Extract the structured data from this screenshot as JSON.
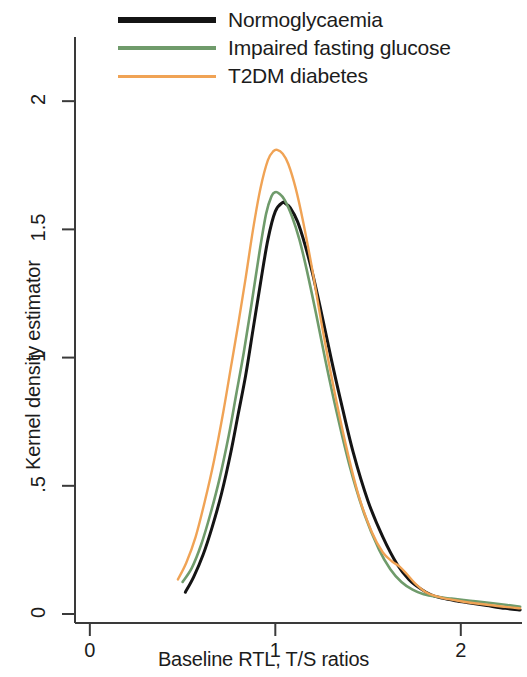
{
  "chart_data": {
    "type": "line",
    "title": "",
    "xlabel": "Baseline RTL, T/S ratios",
    "ylabel": "Kernel density estimator",
    "xlim": [
      -0.08,
      2.33
    ],
    "ylim": [
      -0.035,
      2.18
    ],
    "xticks": [
      0,
      1,
      2
    ],
    "xtick_labels": [
      "0",
      "1",
      "2"
    ],
    "yticks": [
      0,
      0.5,
      1,
      1.5,
      2
    ],
    "ytick_labels": [
      "0",
      ".5",
      "1",
      "1.5",
      "2"
    ],
    "grid": false,
    "legend_position": "top-center",
    "series": [
      {
        "name": "Normoglycaemia",
        "color": "#141414",
        "width": 3.0,
        "x": [
          0.515,
          0.56,
          0.61,
          0.66,
          0.71,
          0.76,
          0.8,
          0.84,
          0.88,
          0.92,
          0.96,
          1.0,
          1.04,
          1.055,
          1.08,
          1.12,
          1.16,
          1.2,
          1.25,
          1.3,
          1.35,
          1.42,
          1.5,
          1.58,
          1.66,
          1.72,
          1.78,
          1.84,
          1.9,
          1.97,
          2.05,
          2.14,
          2.24,
          2.32
        ],
        "y": [
          0.085,
          0.145,
          0.23,
          0.34,
          0.47,
          0.63,
          0.78,
          0.93,
          1.11,
          1.29,
          1.46,
          1.57,
          1.605,
          1.6,
          1.585,
          1.53,
          1.44,
          1.33,
          1.17,
          1.0,
          0.84,
          0.63,
          0.44,
          0.3,
          0.19,
          0.135,
          0.1,
          0.075,
          0.062,
          0.052,
          0.043,
          0.033,
          0.022,
          0.016
        ]
      },
      {
        "name": "Impaired fasting glucose",
        "color": "#6f9b6b",
        "width": 2.6,
        "x": [
          0.5,
          0.55,
          0.6,
          0.65,
          0.7,
          0.75,
          0.79,
          0.83,
          0.87,
          0.91,
          0.95,
          0.98,
          1.0,
          1.02,
          1.05,
          1.09,
          1.13,
          1.17,
          1.22,
          1.27,
          1.33,
          1.4,
          1.48,
          1.56,
          1.62,
          1.68,
          1.74,
          1.8,
          1.87,
          1.95,
          2.05,
          2.15,
          2.25,
          2.32
        ],
        "y": [
          0.125,
          0.18,
          0.27,
          0.39,
          0.53,
          0.7,
          0.86,
          1.02,
          1.2,
          1.39,
          1.56,
          1.63,
          1.645,
          1.64,
          1.615,
          1.55,
          1.46,
          1.34,
          1.17,
          0.99,
          0.79,
          0.58,
          0.39,
          0.25,
          0.175,
          0.125,
          0.095,
          0.077,
          0.067,
          0.06,
          0.052,
          0.044,
          0.035,
          0.028
        ]
      },
      {
        "name": "T2DM diabetes",
        "color": "#f0a355",
        "width": 2.4,
        "x": [
          0.475,
          0.52,
          0.57,
          0.62,
          0.67,
          0.72,
          0.76,
          0.8,
          0.84,
          0.88,
          0.92,
          0.96,
          0.99,
          1.01,
          1.04,
          1.07,
          1.11,
          1.15,
          1.2,
          1.25,
          1.31,
          1.38,
          1.45,
          1.52,
          1.58,
          1.63,
          1.67,
          1.71,
          1.76,
          1.82,
          1.9,
          2.0,
          2.12,
          2.24,
          2.32
        ],
        "y": [
          0.135,
          0.2,
          0.3,
          0.44,
          0.6,
          0.79,
          0.96,
          1.13,
          1.31,
          1.5,
          1.66,
          1.77,
          1.805,
          1.81,
          1.795,
          1.755,
          1.66,
          1.53,
          1.34,
          1.13,
          0.9,
          0.66,
          0.46,
          0.32,
          0.24,
          0.205,
          0.185,
          0.155,
          0.115,
          0.082,
          0.063,
          0.05,
          0.038,
          0.028,
          0.022
        ]
      }
    ]
  },
  "legend": {
    "items": [
      {
        "label": "Normoglycaemia",
        "color": "#141414"
      },
      {
        "label": "Impaired fasting glucose",
        "color": "#6f9b6b"
      },
      {
        "label": "T2DM diabetes",
        "color": "#f0a355"
      }
    ]
  },
  "axes": {
    "y_title": "Kernel density estimator",
    "x_title": "Baseline RTL, T/S ratios",
    "y_labels": [
      "2",
      "1.5",
      "1",
      ".5",
      "0"
    ],
    "x_labels": [
      "0",
      "1",
      "2"
    ],
    "axis_color": "#3a3a3a"
  }
}
